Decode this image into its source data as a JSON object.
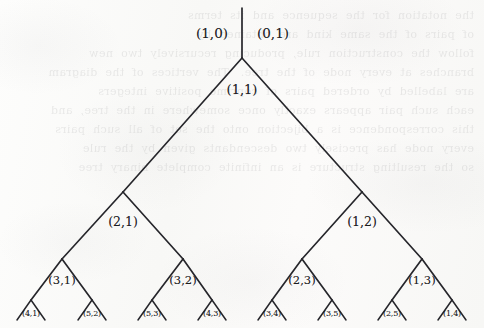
{
  "figure": {
    "background_color": "#fbfbf9",
    "stroke_color": "#26262b",
    "text_color": "#1c1c1f",
    "width": 484,
    "height": 328
  },
  "ghost_text": {
    "line_1": "the  notation  for  the  sequence  and  its  terms",
    "line_2": "of  pairs  of  the  same  kind  are  obtained  by",
    "line_3": "follow  the  construction  rule,  producing  recursively  two  new",
    "line_4": "branches  at  every  node  of  the  tree.   The  vertices  of  the  diagram",
    "line_5": "are  labelled  by  ordered  pairs  of  coprime  positive  integers",
    "line_6": "each  such  pair  appears  exactly  once  somewhere  in  the  tree,  and",
    "line_7": "this  correspondence  is  a  bijection  onto  the  set  of  all  such  pairs",
    "line_8": "every  node  has  precisely  two  descendants  given  by  the  rule",
    "line_9": "so  the  resulting  structure  is  an  infinite  complete  binary  tree"
  },
  "tree": {
    "root_stem": {
      "x": 242,
      "y_top": 8,
      "y_bottom": 58,
      "left_label": "(1,0)",
      "right_label": "(0,1)",
      "left_label_x": 212,
      "right_label_x": 273,
      "label_y": 33
    },
    "levels": [
      {
        "level": 0,
        "y": 58,
        "label_offset_y": 31,
        "nodes": [
          {
            "label": "(1,1)",
            "x": 242,
            "label_x": 242
          }
        ]
      },
      {
        "level": 1,
        "y": 192,
        "label_offset_y": 29,
        "nodes": [
          {
            "label": "(2,1)",
            "x": 123,
            "label_x": 123
          },
          {
            "label": "(1,2)",
            "x": 362,
            "label_x": 362
          }
        ]
      },
      {
        "level": 2,
        "y": 259,
        "label_offset_y": 21,
        "nodes": [
          {
            "label": "(3,1)",
            "x": 62,
            "label_x": 62
          },
          {
            "label": "(3,2)",
            "x": 183,
            "label_x": 183
          },
          {
            "label": "(2,3)",
            "x": 302,
            "label_x": 302
          },
          {
            "label": "(1,3)",
            "x": 422,
            "label_x": 422
          }
        ]
      },
      {
        "level": 3,
        "y": 300,
        "label_offset_y": 13,
        "nodes": [
          {
            "label": "(4,1)",
            "x": 31,
            "label_x": 31
          },
          {
            "label": "(5,2)",
            "x": 92,
            "label_x": 92
          },
          {
            "label": "(5,3)",
            "x": 152,
            "label_x": 152
          },
          {
            "label": "(4,3)",
            "x": 212,
            "label_x": 212
          },
          {
            "label": "(3,4)",
            "x": 272,
            "label_x": 272
          },
          {
            "label": "(3,5)",
            "x": 332,
            "label_x": 332
          },
          {
            "label": "(2,5)",
            "x": 392,
            "label_x": 392
          },
          {
            "label": "(1,4)",
            "x": 452,
            "label_x": 452
          }
        ]
      }
    ],
    "edges": [
      {
        "x1": 242,
        "y1": 8,
        "x2": 242,
        "y2": 58,
        "name": "edge-root-stem"
      },
      {
        "x1": 242,
        "y1": 58,
        "x2": 123,
        "y2": 192,
        "name": "edge-11-to-21"
      },
      {
        "x1": 242,
        "y1": 58,
        "x2": 362,
        "y2": 192,
        "name": "edge-11-to-12"
      },
      {
        "x1": 123,
        "y1": 192,
        "x2": 62,
        "y2": 259,
        "name": "edge-21-to-31"
      },
      {
        "x1": 123,
        "y1": 192,
        "x2": 183,
        "y2": 259,
        "name": "edge-21-to-32"
      },
      {
        "x1": 362,
        "y1": 192,
        "x2": 302,
        "y2": 259,
        "name": "edge-12-to-23"
      },
      {
        "x1": 362,
        "y1": 192,
        "x2": 422,
        "y2": 259,
        "name": "edge-12-to-13"
      },
      {
        "x1": 62,
        "y1": 259,
        "x2": 31,
        "y2": 300,
        "name": "edge-31-to-41"
      },
      {
        "x1": 62,
        "y1": 259,
        "x2": 92,
        "y2": 300,
        "name": "edge-31-to-52"
      },
      {
        "x1": 183,
        "y1": 259,
        "x2": 152,
        "y2": 300,
        "name": "edge-32-to-53"
      },
      {
        "x1": 183,
        "y1": 259,
        "x2": 212,
        "y2": 300,
        "name": "edge-32-to-43"
      },
      {
        "x1": 302,
        "y1": 259,
        "x2": 272,
        "y2": 300,
        "name": "edge-23-to-34"
      },
      {
        "x1": 302,
        "y1": 259,
        "x2": 332,
        "y2": 300,
        "name": "edge-23-to-35"
      },
      {
        "x1": 422,
        "y1": 259,
        "x2": 392,
        "y2": 300,
        "name": "edge-13-to-25"
      },
      {
        "x1": 422,
        "y1": 259,
        "x2": 452,
        "y2": 300,
        "name": "edge-13-to-14"
      },
      {
        "x1": 31,
        "y1": 300,
        "x2": 17,
        "y2": 320,
        "name": "edge-leaf-41-left"
      },
      {
        "x1": 31,
        "y1": 300,
        "x2": 45,
        "y2": 320,
        "name": "edge-leaf-41-right"
      },
      {
        "x1": 92,
        "y1": 300,
        "x2": 78,
        "y2": 320,
        "name": "edge-leaf-52-left"
      },
      {
        "x1": 92,
        "y1": 300,
        "x2": 106,
        "y2": 320,
        "name": "edge-leaf-52-right"
      },
      {
        "x1": 152,
        "y1": 300,
        "x2": 138,
        "y2": 320,
        "name": "edge-leaf-53-left"
      },
      {
        "x1": 152,
        "y1": 300,
        "x2": 166,
        "y2": 320,
        "name": "edge-leaf-53-right"
      },
      {
        "x1": 212,
        "y1": 300,
        "x2": 198,
        "y2": 320,
        "name": "edge-leaf-43-left"
      },
      {
        "x1": 212,
        "y1": 300,
        "x2": 226,
        "y2": 320,
        "name": "edge-leaf-43-right"
      },
      {
        "x1": 272,
        "y1": 300,
        "x2": 258,
        "y2": 320,
        "name": "edge-leaf-34-left"
      },
      {
        "x1": 272,
        "y1": 300,
        "x2": 286,
        "y2": 320,
        "name": "edge-leaf-34-right"
      },
      {
        "x1": 332,
        "y1": 300,
        "x2": 318,
        "y2": 320,
        "name": "edge-leaf-35-left"
      },
      {
        "x1": 332,
        "y1": 300,
        "x2": 346,
        "y2": 320,
        "name": "edge-leaf-35-right"
      },
      {
        "x1": 392,
        "y1": 300,
        "x2": 378,
        "y2": 320,
        "name": "edge-leaf-25-left"
      },
      {
        "x1": 392,
        "y1": 300,
        "x2": 406,
        "y2": 320,
        "name": "edge-leaf-25-right"
      },
      {
        "x1": 452,
        "y1": 300,
        "x2": 438,
        "y2": 320,
        "name": "edge-leaf-14-left"
      },
      {
        "x1": 452,
        "y1": 300,
        "x2": 466,
        "y2": 320,
        "name": "edge-leaf-14-right"
      }
    ]
  }
}
